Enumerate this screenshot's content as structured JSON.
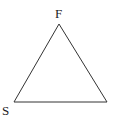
{
  "diagram": {
    "type": "triangle",
    "vertices": [
      {
        "label": "F",
        "x": 59,
        "y": 24
      },
      {
        "label": "S",
        "x": 14,
        "y": 102
      },
      {
        "label": "",
        "x": 107,
        "y": 102
      }
    ],
    "stroke_color": "#333333"
  }
}
